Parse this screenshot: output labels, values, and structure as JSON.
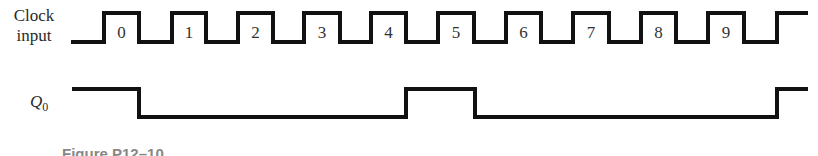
{
  "diagram": {
    "type": "timing-diagram",
    "signals": [
      {
        "name": "Clock input",
        "label_line1": "Clock",
        "label_line2": "input",
        "pulses": [
          "0",
          "1",
          "2",
          "3",
          "4",
          "5",
          "6",
          "7",
          "8",
          "9"
        ]
      },
      {
        "name": "Q0",
        "label_main": "Q",
        "label_sub": "0",
        "high_intervals": [
          [
            "start",
            "falling edge of pulse 0"
          ],
          [
            "falling edge of pulse 4",
            "falling edge of pulse 5"
          ],
          [
            "falling edge of pulse 9",
            "end"
          ]
        ]
      }
    ],
    "caption": "Figure P12–10"
  }
}
